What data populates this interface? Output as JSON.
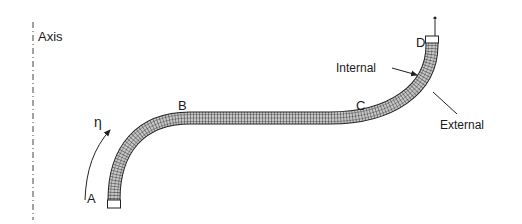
{
  "diagram": {
    "axis_label": "Axis",
    "points": {
      "a": "A",
      "b": "B",
      "c": "C",
      "d": "D"
    },
    "coordinate_symbol": "η",
    "surface_labels": {
      "internal": "Internal",
      "external": "External"
    },
    "colors": {
      "line": "#222222",
      "band_fill": "#bdbdbd",
      "grid": "#333333"
    }
  }
}
